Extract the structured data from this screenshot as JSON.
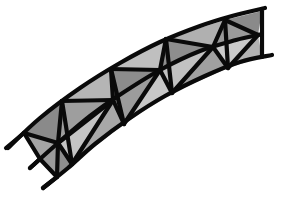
{
  "figure": {
    "title": "",
    "width": 284,
    "height": 200,
    "background": "#ffffff",
    "stroke_color": "#0a0a0a",
    "stroke_width": 4.2
  },
  "chords": {
    "top": [
      [
        8,
        148
      ],
      [
        40,
        118
      ],
      [
        80,
        88
      ],
      [
        120,
        63
      ],
      [
        160,
        42
      ],
      [
        200,
        26
      ],
      [
        232,
        16
      ],
      [
        265,
        8
      ]
    ],
    "middle": [
      [
        30,
        168
      ],
      [
        58,
        143
      ],
      [
        90,
        116
      ],
      [
        118,
        96
      ],
      [
        160,
        70
      ],
      [
        200,
        51
      ],
      [
        236,
        40
      ],
      [
        262,
        34
      ]
    ],
    "bottom": [
      [
        43,
        188
      ],
      [
        68,
        168
      ],
      [
        95,
        144
      ],
      [
        130,
        118
      ],
      [
        165,
        96
      ],
      [
        205,
        76
      ],
      [
        240,
        62
      ],
      [
        272,
        55
      ]
    ]
  },
  "nodes": {
    "top": [
      [
        24,
        133
      ],
      [
        62,
        101
      ],
      [
        111,
        69
      ],
      [
        166,
        39
      ],
      [
        225,
        20
      ],
      [
        262,
        11
      ]
    ],
    "middle": [
      [
        40,
        159
      ],
      [
        58,
        143
      ],
      [
        113,
        100
      ],
      [
        160,
        70
      ],
      [
        213,
        47
      ],
      [
        258,
        35
      ]
    ],
    "bottom": [
      [
        57,
        177
      ],
      [
        72,
        164
      ],
      [
        124,
        124
      ],
      [
        172,
        93
      ],
      [
        228,
        68
      ],
      [
        262,
        57
      ]
    ]
  },
  "panels": [
    {
      "cells": [
        {
          "pts": [
            [
              24,
              133
            ],
            [
              62,
              101
            ],
            [
              58,
              143
            ]
          ],
          "fill": "#8a8a8a"
        },
        {
          "pts": [
            [
              24,
              133
            ],
            [
              58,
              143
            ],
            [
              40,
              159
            ]
          ],
          "fill": "#a5a5a5"
        },
        {
          "pts": [
            [
              40,
              159
            ],
            [
              58,
              143
            ],
            [
              57,
              177
            ]
          ],
          "fill": "#9a9a9a"
        },
        {
          "pts": [
            [
              57,
              177
            ],
            [
              58,
              143
            ],
            [
              72,
              164
            ]
          ],
          "fill": "#8f8f8f"
        },
        {
          "pts": [
            [
              58,
              143
            ],
            [
              62,
              101
            ],
            [
              113,
              100
            ]
          ],
          "fill": "#9e9e9e"
        },
        {
          "pts": [
            [
              58,
              143
            ],
            [
              113,
              100
            ],
            [
              72,
              164
            ]
          ],
          "fill": "#c4c4c4"
        },
        {
          "pts": [
            [
              72,
              164
            ],
            [
              113,
              100
            ],
            [
              124,
              124
            ]
          ],
          "fill": "#a8a8a8"
        }
      ]
    },
    {
      "cells": [
        {
          "pts": [
            [
              62,
              101
            ],
            [
              111,
              69
            ],
            [
              113,
              100
            ]
          ],
          "fill": "#b5b5b5"
        },
        {
          "pts": [
            [
              111,
              69
            ],
            [
              160,
              70
            ],
            [
              113,
              100
            ]
          ],
          "fill": "#8c8c8c"
        },
        {
          "pts": [
            [
              111,
              69
            ],
            [
              166,
              39
            ],
            [
              160,
              70
            ]
          ],
          "fill": "#bfbfbf"
        },
        {
          "pts": [
            [
              113,
              100
            ],
            [
              160,
              70
            ],
            [
              124,
              124
            ]
          ],
          "fill": "#9c9c9c"
        },
        {
          "pts": [
            [
              124,
              124
            ],
            [
              160,
              70
            ],
            [
              172,
              93
            ]
          ],
          "fill": "#c8c8c8"
        }
      ]
    },
    {
      "cells": [
        {
          "pts": [
            [
              166,
              39
            ],
            [
              213,
              47
            ],
            [
              160,
              70
            ]
          ],
          "fill": "#8e8e8e"
        },
        {
          "pts": [
            [
              166,
              39
            ],
            [
              225,
              20
            ],
            [
              213,
              47
            ]
          ],
          "fill": "#b0b0b0"
        },
        {
          "pts": [
            [
              160,
              70
            ],
            [
              213,
              47
            ],
            [
              172,
              93
            ]
          ],
          "fill": "#c2c2c2"
        },
        {
          "pts": [
            [
              172,
              93
            ],
            [
              213,
              47
            ],
            [
              228,
              68
            ]
          ],
          "fill": "#a0a0a0"
        },
        {
          "pts": [
            [
              213,
              47
            ],
            [
              258,
              35
            ],
            [
              228,
              68
            ]
          ],
          "fill": "#cacaca"
        },
        {
          "pts": [
            [
              225,
              20
            ],
            [
              262,
              11
            ],
            [
              258,
              35
            ]
          ],
          "fill": "#8a8a8a"
        },
        {
          "pts": [
            [
              225,
              20
            ],
            [
              258,
              35
            ],
            [
              213,
              47
            ]
          ],
          "fill": "#9a9a9a"
        },
        {
          "pts": [
            [
              228,
              68
            ],
            [
              258,
              35
            ],
            [
              262,
              57
            ]
          ],
          "fill": "#b3b3b3"
        }
      ]
    }
  ],
  "members": [
    [
      [
        24,
        133
      ],
      [
        40,
        159
      ]
    ],
    [
      [
        40,
        159
      ],
      [
        57,
        177
      ]
    ],
    [
      [
        62,
        101
      ],
      [
        72,
        164
      ]
    ],
    [
      [
        111,
        69
      ],
      [
        124,
        124
      ]
    ],
    [
      [
        166,
        39
      ],
      [
        172,
        93
      ]
    ],
    [
      [
        225,
        20
      ],
      [
        228,
        68
      ]
    ],
    [
      [
        262,
        11
      ],
      [
        262,
        57
      ]
    ],
    [
      [
        24,
        133
      ],
      [
        58,
        143
      ]
    ],
    [
      [
        62,
        101
      ],
      [
        58,
        143
      ]
    ],
    [
      [
        58,
        143
      ],
      [
        57,
        177
      ]
    ],
    [
      [
        58,
        143
      ],
      [
        72,
        164
      ]
    ],
    [
      [
        58,
        143
      ],
      [
        113,
        100
      ]
    ],
    [
      [
        62,
        101
      ],
      [
        113,
        100
      ]
    ],
    [
      [
        111,
        69
      ],
      [
        113,
        100
      ]
    ],
    [
      [
        113,
        100
      ],
      [
        124,
        124
      ]
    ],
    [
      [
        113,
        100
      ],
      [
        72,
        164
      ]
    ],
    [
      [
        111,
        69
      ],
      [
        160,
        70
      ]
    ],
    [
      [
        166,
        39
      ],
      [
        160,
        70
      ]
    ],
    [
      [
        160,
        70
      ],
      [
        124,
        124
      ]
    ],
    [
      [
        160,
        70
      ],
      [
        172,
        93
      ]
    ],
    [
      [
        166,
        39
      ],
      [
        213,
        47
      ]
    ],
    [
      [
        225,
        20
      ],
      [
        213,
        47
      ]
    ],
    [
      [
        213,
        47
      ],
      [
        172,
        93
      ]
    ],
    [
      [
        213,
        47
      ],
      [
        228,
        68
      ]
    ],
    [
      [
        225,
        20
      ],
      [
        258,
        35
      ]
    ],
    [
      [
        258,
        35
      ],
      [
        228,
        68
      ]
    ]
  ],
  "tails": [
    [
      [
        24,
        133
      ],
      [
        6,
        148
      ]
    ],
    [
      [
        40,
        159
      ],
      [
        30,
        168
      ]
    ],
    [
      [
        57,
        177
      ],
      [
        43,
        188
      ]
    ]
  ]
}
